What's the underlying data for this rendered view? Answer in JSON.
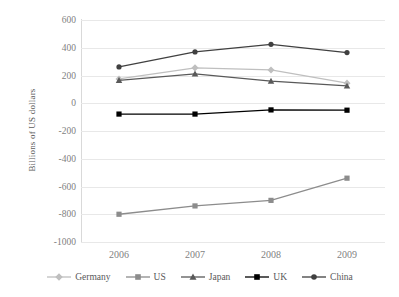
{
  "chart_data": {
    "type": "line",
    "title": "",
    "xlabel": "",
    "ylabel": "Billions of US dollars",
    "categories": [
      "2006",
      "2007",
      "2008",
      "2009"
    ],
    "ylim": [
      -1000,
      600
    ],
    "ytick_step": 200,
    "yticks": [
      "600",
      "400",
      "200",
      "0",
      "-200",
      "-400",
      "-600",
      "-800",
      "-1000"
    ],
    "grid": true,
    "legend_position": "bottom",
    "series": [
      {
        "name": "Germany",
        "color": "#bfbfbf",
        "marker": "diamond",
        "values": [
          175,
          255,
          240,
          145
        ]
      },
      {
        "name": "US",
        "color": "#8c8c8c",
        "marker": "square",
        "values": [
          -800,
          -740,
          -700,
          -540
        ]
      },
      {
        "name": "Japan",
        "color": "#595959",
        "marker": "triangle",
        "values": [
          165,
          212,
          160,
          125
        ]
      },
      {
        "name": "UK",
        "color": "#000000",
        "marker": "square",
        "values": [
          -78,
          -78,
          -48,
          -50
        ]
      },
      {
        "name": "China",
        "color": "#404040",
        "marker": "circle",
        "values": [
          262,
          370,
          425,
          365
        ]
      }
    ]
  }
}
